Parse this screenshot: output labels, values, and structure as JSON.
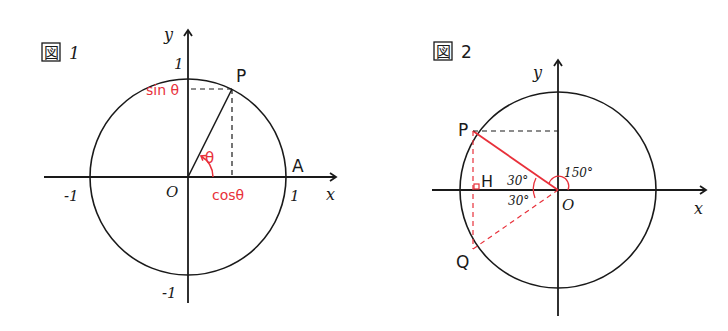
{
  "colors": {
    "ink": "#1a1a1a",
    "accent": "#e8303a"
  },
  "figure1": {
    "title_kanji": "図",
    "title_num": "1",
    "axis_x": "x",
    "axis_y": "y",
    "origin": "O",
    "tick_x_pos": "1",
    "tick_x_neg": "-1",
    "tick_y_pos": "1",
    "tick_y_neg": "-1",
    "point_p": "P",
    "point_a": "A",
    "angle_label": "θ",
    "sin_label": "sin θ",
    "cos_label": "cosθ"
  },
  "figure2": {
    "title_kanji": "図",
    "title_num": "2",
    "axis_x": "x",
    "axis_y": "y",
    "origin": "O",
    "point_p": "P",
    "point_q": "Q",
    "point_h": "H",
    "angle_upper": "30°",
    "angle_lower": "30°",
    "angle_150": "150°"
  }
}
